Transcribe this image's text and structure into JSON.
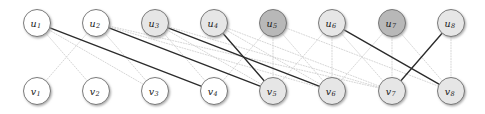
{
  "figure": {
    "width": 485,
    "height": 114,
    "background": "#ffffff"
  },
  "style": {
    "node_radius": 13.5,
    "node_stroke": "#6e6e6e",
    "fill_white": "#ffffff",
    "fill_light": "#e6e6e6",
    "fill_dark": "#b8b8b8",
    "edge_solid_color": "#2b2b2b",
    "edge_dotted_color": "#cfcfcf",
    "shadow_color": "#9a9a9a"
  },
  "graph": {
    "type": "bipartite",
    "top_row_y": 23,
    "bottom_row_y": 91,
    "column_x": [
      37,
      96,
      155,
      214,
      273,
      332,
      392,
      451
    ],
    "top_nodes": [
      {
        "id": "u1",
        "base": "u",
        "sub": "1",
        "x": 37,
        "y": 23,
        "shade": "white"
      },
      {
        "id": "u2",
        "base": "u",
        "sub": "2",
        "x": 96,
        "y": 23,
        "shade": "white"
      },
      {
        "id": "u3",
        "base": "u",
        "sub": "3",
        "x": 155,
        "y": 23,
        "shade": "light"
      },
      {
        "id": "u4",
        "base": "u",
        "sub": "4",
        "x": 214,
        "y": 23,
        "shade": "light"
      },
      {
        "id": "u5",
        "base": "u",
        "sub": "5",
        "x": 273,
        "y": 23,
        "shade": "dark"
      },
      {
        "id": "u6",
        "base": "u",
        "sub": "6",
        "x": 332,
        "y": 23,
        "shade": "light"
      },
      {
        "id": "u7",
        "base": "u",
        "sub": "7",
        "x": 392,
        "y": 23,
        "shade": "dark"
      },
      {
        "id": "u8",
        "base": "u",
        "sub": "8",
        "x": 451,
        "y": 23,
        "shade": "light"
      }
    ],
    "bottom_nodes": [
      {
        "id": "v1",
        "base": "v",
        "sub": "1",
        "x": 37,
        "y": 91,
        "shade": "white"
      },
      {
        "id": "v2",
        "base": "v",
        "sub": "2",
        "x": 96,
        "y": 91,
        "shade": "white"
      },
      {
        "id": "v3",
        "base": "v",
        "sub": "3",
        "x": 155,
        "y": 91,
        "shade": "white"
      },
      {
        "id": "v4",
        "base": "v",
        "sub": "4",
        "x": 214,
        "y": 91,
        "shade": "white"
      },
      {
        "id": "v5",
        "base": "v",
        "sub": "5",
        "x": 273,
        "y": 91,
        "shade": "light"
      },
      {
        "id": "v6",
        "base": "v",
        "sub": "6",
        "x": 332,
        "y": 91,
        "shade": "light"
      },
      {
        "id": "v7",
        "base": "v",
        "sub": "7",
        "x": 392,
        "y": 91,
        "shade": "light"
      },
      {
        "id": "v8",
        "base": "v",
        "sub": "8",
        "x": 451,
        "y": 91,
        "shade": "light"
      }
    ],
    "solid_edges": [
      {
        "from": "u1",
        "to": "v4"
      },
      {
        "from": "u2",
        "to": "v5"
      },
      {
        "from": "u3",
        "to": "v6"
      },
      {
        "from": "u4",
        "to": "v5"
      },
      {
        "from": "u6",
        "to": "v8"
      },
      {
        "from": "u8",
        "to": "v7"
      }
    ],
    "dotted_edges": [
      {
        "from": "u1",
        "to": "v2"
      },
      {
        "from": "u2",
        "to": "v1"
      },
      {
        "from": "u1",
        "to": "v3"
      },
      {
        "from": "u2",
        "to": "v3"
      },
      {
        "from": "u2",
        "to": "v6"
      },
      {
        "from": "u2",
        "to": "v7"
      },
      {
        "from": "u3",
        "to": "v4"
      },
      {
        "from": "u3",
        "to": "v5"
      },
      {
        "from": "u3",
        "to": "v7"
      },
      {
        "from": "u4",
        "to": "v6"
      },
      {
        "from": "u4",
        "to": "v7"
      },
      {
        "from": "u5",
        "to": "v5"
      },
      {
        "from": "u5",
        "to": "v6"
      },
      {
        "from": "u5",
        "to": "v4"
      },
      {
        "from": "u6",
        "to": "v5"
      },
      {
        "from": "u6",
        "to": "v6"
      },
      {
        "from": "u6",
        "to": "v7"
      },
      {
        "from": "u7",
        "to": "v6"
      },
      {
        "from": "u7",
        "to": "v7"
      },
      {
        "from": "u7",
        "to": "v8"
      },
      {
        "from": "u8",
        "to": "v8"
      },
      {
        "from": "u5",
        "to": "v8"
      }
    ]
  }
}
